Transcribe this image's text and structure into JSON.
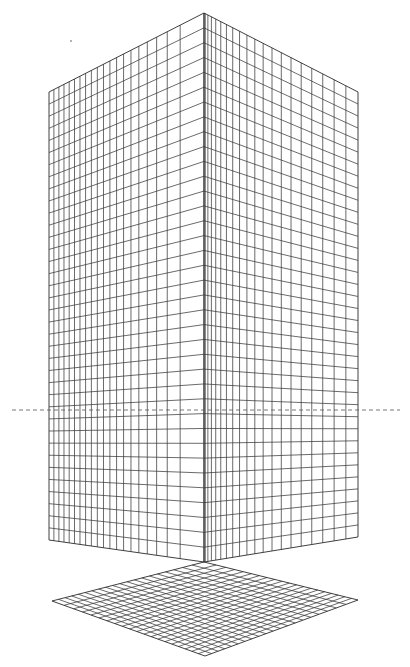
{
  "figure": {
    "colors": {
      "background": "#ffffff",
      "grid_line": "#3a3a3a",
      "horizon_line": "#555555",
      "dot": "#9a9a9a"
    },
    "block": {
      "left_face": {
        "corners": [
          [
            49,
            92
          ],
          [
            204,
            13
          ],
          [
            204,
            562
          ],
          [
            49,
            540
          ]
        ],
        "columns": 20,
        "rows": 37,
        "column_perspective": 1.6
      },
      "right_face": {
        "corners": [
          [
            204,
            13
          ],
          [
            358,
            92
          ],
          [
            358,
            537
          ],
          [
            204,
            562
          ]
        ],
        "columns": 20,
        "rows": 37,
        "column_perspective": 0.625
      }
    },
    "floor": {
      "corners": [
        [
          204,
          562
        ],
        [
          358,
          600
        ],
        [
          205,
          656
        ],
        [
          52,
          601
        ]
      ],
      "divisions_a": 20,
      "divisions_b": 20
    },
    "horizon": {
      "y": 410,
      "segments": [
        [
          12,
          400
        ]
      ]
    },
    "marker_dot": {
      "x": 71,
      "y": 41,
      "r": 1
    }
  }
}
